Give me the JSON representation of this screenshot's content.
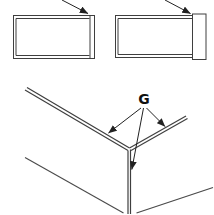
{
  "colors": {
    "background": "#ffffff",
    "line": "#3f3f3f",
    "arrow": "#222222",
    "label": "#111111"
  },
  "callout": {
    "label": "G"
  },
  "icons": {
    "pointer_arrow_left_panel": "arrow-down-right",
    "pointer_arrow_right_panel": "arrow-down-right",
    "leader_arrows_from_g": 3
  }
}
